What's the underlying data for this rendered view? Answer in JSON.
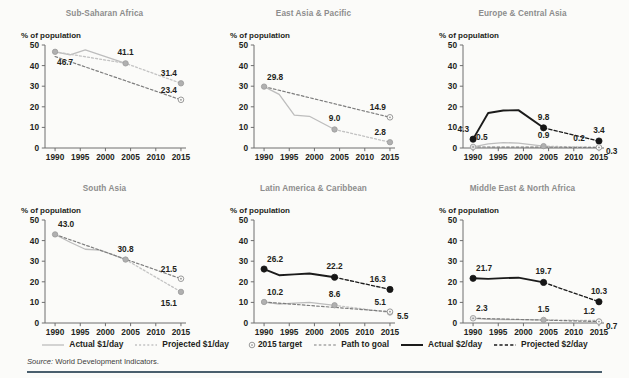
{
  "figure": {
    "axis_label": "% of population",
    "source_prefix": "Source:",
    "source_text": "World Development Indicators."
  },
  "legend": {
    "items": [
      {
        "label": "Actual $1/day",
        "key": "solid-light-line",
        "color": "#b9b9b9"
      },
      {
        "label": "Projected $1/day",
        "key": "dotted-light-line",
        "color": "#b9b9b9"
      },
      {
        "label": "2015 target",
        "key": "open-circle-marker",
        "color": "#9a9a9a"
      },
      {
        "label": "Path to goal",
        "key": "dashed-dark-line",
        "color": "#6d6d6d"
      },
      {
        "label": "Actual $2/day",
        "key": "solid-dark-line",
        "color": "#1b1b1b"
      },
      {
        "label": "Projected $2/day",
        "key": "dashed-black-line",
        "color": "#1b1b1b"
      }
    ]
  },
  "chart_data": {
    "type": "line",
    "title": "",
    "xlabel": "",
    "ylabel": "% of population",
    "xlim": [
      1988,
      2016
    ],
    "ylim": [
      0,
      50
    ],
    "ytick_labels": [
      "0",
      "10",
      "20",
      "30",
      "40",
      "50"
    ],
    "ytick_values": [
      0,
      10,
      20,
      30,
      40,
      50
    ],
    "xtick_labels": [
      "1990",
      "1995",
      "2000",
      "2005",
      "2010",
      "2015"
    ],
    "xtick_values": [
      1990,
      1995,
      2000,
      2005,
      2010,
      2015
    ],
    "grid": false,
    "legend_position": "bottom",
    "panels": [
      {
        "name": "Sub-Saharan Africa",
        "series": [
          {
            "name": "Actual $1/day",
            "style": "solid-light",
            "x": [
              1990,
              1993,
              1996,
              2004
            ],
            "y": [
              46.7,
              45.2,
              47.6,
              41.1
            ]
          },
          {
            "name": "Projected $1/day",
            "style": "dotted-light",
            "x": [
              1990,
              2004,
              2015
            ],
            "y": [
              46.7,
              41.1,
              31.4
            ]
          },
          {
            "name": "Path to goal",
            "style": "dashed-dark",
            "x": [
              1990,
              2015
            ],
            "y": [
              44.4,
              23.4
            ]
          }
        ],
        "markers": [
          {
            "label": "46.7",
            "x": 1990,
            "y": 46.7,
            "kind": "filled-light",
            "pos": "below-right"
          },
          {
            "label": "41.1",
            "x": 2004,
            "y": 41.1,
            "kind": "filled-light",
            "pos": "above"
          },
          {
            "label": "31.4",
            "x": 2015,
            "y": 31.4,
            "kind": "filled-light",
            "pos": "above-left"
          },
          {
            "label": "23.4",
            "x": 2015,
            "y": 23.4,
            "kind": "open",
            "pos": "above-left"
          }
        ]
      },
      {
        "name": "East Asia & Pacific",
        "series": [
          {
            "name": "Actual $1/day",
            "style": "solid-light",
            "x": [
              1990,
              1993,
              1996,
              1999,
              2004
            ],
            "y": [
              29.8,
              26.0,
              16.0,
              15.4,
              9.0
            ]
          },
          {
            "name": "Projected $1/day",
            "style": "dotted-light",
            "x": [
              2004,
              2015
            ],
            "y": [
              9.0,
              2.8
            ]
          },
          {
            "name": "Path to goal",
            "style": "dashed-dark",
            "x": [
              1990,
              2015
            ],
            "y": [
              29.8,
              14.9
            ]
          }
        ],
        "markers": [
          {
            "label": "29.8",
            "x": 1990,
            "y": 29.8,
            "kind": "filled-light",
            "pos": "above-right"
          },
          {
            "label": "9.0",
            "x": 2004,
            "y": 9.0,
            "kind": "filled-light",
            "pos": "above"
          },
          {
            "label": "14.9",
            "x": 2015,
            "y": 14.9,
            "kind": "open",
            "pos": "above-left"
          },
          {
            "label": "2.8",
            "x": 2015,
            "y": 2.8,
            "kind": "filled-light",
            "pos": "above-left"
          }
        ]
      },
      {
        "name": "Europe & Central Asia",
        "series": [
          {
            "name": "Actual $2/day",
            "style": "solid-dark",
            "x": [
              1990,
              1993,
              1996,
              1999,
              2004
            ],
            "y": [
              4.3,
              17.0,
              18.2,
              18.4,
              9.8
            ]
          },
          {
            "name": "Projected $2/day",
            "style": "dashed-black",
            "x": [
              2004,
              2015
            ],
            "y": [
              9.8,
              3.4
            ]
          },
          {
            "name": "Actual $1/day",
            "style": "solid-light",
            "x": [
              1990,
              1993,
              1996,
              1999,
              2004
            ],
            "y": [
              0.5,
              2.0,
              2.6,
              2.4,
              0.9
            ]
          },
          {
            "name": "Projected $1/day",
            "style": "dotted-light",
            "x": [
              2004,
              2015
            ],
            "y": [
              0.9,
              0.2
            ]
          },
          {
            "name": "Path to goal",
            "style": "dashed-dark",
            "x": [
              1990,
              2015
            ],
            "y": [
              0.5,
              0.3
            ]
          }
        ],
        "markers": [
          {
            "label": "4.3",
            "x": 1990,
            "y": 4.3,
            "kind": "filled-dark",
            "pos": "above-left"
          },
          {
            "label": "0.5",
            "x": 1990,
            "y": 0.5,
            "kind": "open-light",
            "pos": "above-right"
          },
          {
            "label": "9.8",
            "x": 2004,
            "y": 9.8,
            "kind": "filled-dark",
            "pos": "above"
          },
          {
            "label": "0.9",
            "x": 2004,
            "y": 0.9,
            "kind": "filled-light",
            "pos": "above"
          },
          {
            "label": "3.4",
            "x": 2015,
            "y": 3.4,
            "kind": "filled-dark",
            "pos": "above"
          },
          {
            "label": "0.2",
            "x": 2013,
            "y": 0.2,
            "kind": "none",
            "pos": "above-left"
          },
          {
            "label": "0.3",
            "x": 2015,
            "y": 0.3,
            "kind": "open",
            "pos": "right"
          }
        ]
      },
      {
        "name": "South Asia",
        "series": [
          {
            "name": "Actual $1/day",
            "style": "solid-light",
            "x": [
              1990,
              1993,
              1996,
              1999,
              2004
            ],
            "y": [
              43.0,
              39.2,
              35.8,
              35.4,
              30.8
            ]
          },
          {
            "name": "Projected $1/day",
            "style": "dotted-light",
            "x": [
              2004,
              2015
            ],
            "y": [
              30.8,
              15.1
            ]
          },
          {
            "name": "Path to goal",
            "style": "dashed-dark",
            "x": [
              1990,
              2015
            ],
            "y": [
              43.0,
              21.5
            ]
          }
        ],
        "markers": [
          {
            "label": "43.0",
            "x": 1990,
            "y": 43.0,
            "kind": "filled-light",
            "pos": "above-right"
          },
          {
            "label": "30.8",
            "x": 2004,
            "y": 30.8,
            "kind": "filled-light",
            "pos": "above"
          },
          {
            "label": "21.5",
            "x": 2015,
            "y": 21.5,
            "kind": "open",
            "pos": "above-left"
          },
          {
            "label": "15.1",
            "x": 2015,
            "y": 15.1,
            "kind": "filled-light",
            "pos": "below-left"
          }
        ]
      },
      {
        "name": "Latin America & Caribbean",
        "series": [
          {
            "name": "Actual $2/day",
            "style": "solid-dark",
            "x": [
              1990,
              1993,
              1996,
              1999,
              2004
            ],
            "y": [
              26.2,
              23.2,
              23.6,
              24.0,
              22.2
            ]
          },
          {
            "name": "Projected $2/day",
            "style": "dashed-black",
            "x": [
              2004,
              2015
            ],
            "y": [
              22.2,
              16.3
            ]
          },
          {
            "name": "Actual $1/day",
            "style": "solid-light",
            "x": [
              1990,
              1993,
              1996,
              1999,
              2004
            ],
            "y": [
              10.2,
              9.2,
              9.6,
              10.0,
              8.6
            ]
          },
          {
            "name": "Projected $1/day",
            "style": "dotted-light",
            "x": [
              2004,
              2015
            ],
            "y": [
              8.6,
              5.1
            ]
          },
          {
            "name": "Path to goal",
            "style": "dashed-dark",
            "x": [
              1990,
              2015
            ],
            "y": [
              10.2,
              5.5
            ]
          }
        ],
        "markers": [
          {
            "label": "26.2",
            "x": 1990,
            "y": 26.2,
            "kind": "filled-dark",
            "pos": "above-right"
          },
          {
            "label": "10.2",
            "x": 1990,
            "y": 10.2,
            "kind": "filled-light",
            "pos": "above-right"
          },
          {
            "label": "22.2",
            "x": 2004,
            "y": 22.2,
            "kind": "filled-dark",
            "pos": "above"
          },
          {
            "label": "8.6",
            "x": 2004,
            "y": 8.6,
            "kind": "filled-light",
            "pos": "above"
          },
          {
            "label": "16.3",
            "x": 2015,
            "y": 16.3,
            "kind": "filled-dark",
            "pos": "above-left"
          },
          {
            "label": "5.1",
            "x": 2015,
            "y": 5.1,
            "kind": "filled-light",
            "pos": "above-left"
          },
          {
            "label": "5.5",
            "x": 2015,
            "y": 5.5,
            "kind": "open",
            "pos": "right"
          }
        ]
      },
      {
        "name": "Middle East & North Africa",
        "series": [
          {
            "name": "Actual $2/day",
            "style": "solid-dark",
            "x": [
              1990,
              1993,
              1996,
              1999,
              2004
            ],
            "y": [
              21.7,
              21.4,
              21.8,
              22.0,
              19.7
            ]
          },
          {
            "name": "Projected $2/day",
            "style": "dashed-black",
            "x": [
              2004,
              2015
            ],
            "y": [
              19.7,
              10.3
            ]
          },
          {
            "name": "Actual $1/day",
            "style": "solid-light",
            "x": [
              1990,
              1993,
              1996,
              1999,
              2004
            ],
            "y": [
              2.3,
              1.8,
              1.7,
              1.6,
              1.5
            ]
          },
          {
            "name": "Projected $1/day",
            "style": "dotted-light",
            "x": [
              2004,
              2015
            ],
            "y": [
              1.5,
              1.2
            ]
          },
          {
            "name": "Path to goal",
            "style": "dashed-dark",
            "x": [
              1990,
              2015
            ],
            "y": [
              2.3,
              0.7
            ]
          }
        ],
        "markers": [
          {
            "label": "21.7",
            "x": 1990,
            "y": 21.7,
            "kind": "filled-dark",
            "pos": "above-right"
          },
          {
            "label": "2.3",
            "x": 1990,
            "y": 2.3,
            "kind": "open-light",
            "pos": "above-right"
          },
          {
            "label": "19.7",
            "x": 2004,
            "y": 19.7,
            "kind": "filled-dark",
            "pos": "above"
          },
          {
            "label": "1.5",
            "x": 2004,
            "y": 1.5,
            "kind": "filled-light",
            "pos": "above"
          },
          {
            "label": "10.3",
            "x": 2015,
            "y": 10.3,
            "kind": "filled-dark",
            "pos": "above"
          },
          {
            "label": "1.2",
            "x": 2015,
            "y": 1.2,
            "kind": "none",
            "pos": "above-left"
          },
          {
            "label": "0.7",
            "x": 2015,
            "y": 0.7,
            "kind": "open",
            "pos": "right"
          }
        ]
      }
    ]
  }
}
